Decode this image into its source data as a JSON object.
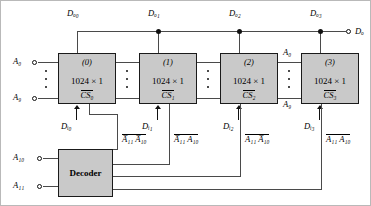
{
  "diagram": {
    "output_terminal_label": "Dₒ",
    "memory_blocks": [
      {
        "number": "(0)",
        "capacity": "1024 × 1",
        "cs_label": "CS₀",
        "data_out_label": "Dₒ₀",
        "data_in_label": "Dᵢ₀",
        "select_term": "A̅₁₁ A̅₁₀"
      },
      {
        "number": "(1)",
        "capacity": "1024 × 1",
        "cs_label": "CS₁",
        "data_out_label": "Dₒ₁",
        "data_in_label": "Dᵢ₁",
        "select_term": "A̅₁₁ A₁₀"
      },
      {
        "number": "(2)",
        "capacity": "1024 × 1",
        "cs_label": "CS₂",
        "data_out_label": "Dₒ₂",
        "data_in_label": "Dᵢ₂",
        "select_term": "A₁₁ A̅₁₀"
      },
      {
        "number": "(3)",
        "capacity": "1024 × 1",
        "cs_label": "CS₃",
        "data_out_label": "Dₒ₃",
        "data_in_label": "Dᵢ₃",
        "select_term": "A₁₁ A₁₀"
      }
    ],
    "address_bus_left": {
      "top": "A₀",
      "bottom": "A₉"
    },
    "address_bus_right": {
      "top": "A₀",
      "bottom": "A₉"
    },
    "decoder": {
      "label": "Decoder",
      "inputs": [
        "A₁₀",
        "A₁₁"
      ]
    },
    "colors": {
      "block_fill": "#c9c9c9",
      "block_stroke": "#1a1a1a",
      "wire": "#4a4a4a",
      "background": "#ffffff"
    }
  }
}
